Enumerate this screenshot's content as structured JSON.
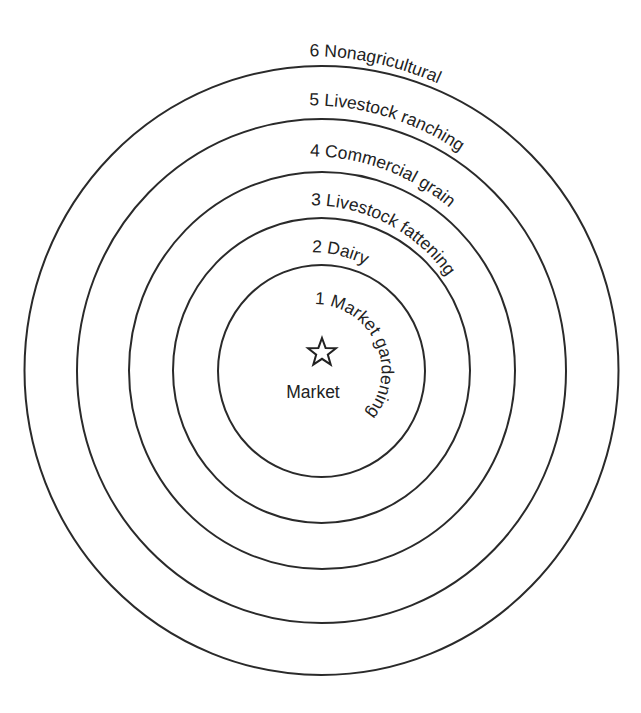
{
  "diagram": {
    "center": {
      "label": "Market",
      "icon": "star-icon"
    },
    "zones": [
      {
        "number": "1",
        "name": "Market gardening",
        "text": "1  Market gardening"
      },
      {
        "number": "2",
        "name": "Dairy",
        "text": "2  Dairy"
      },
      {
        "number": "3",
        "name": "Livestock fattening",
        "text": "3  Livestock fattening"
      },
      {
        "number": "4",
        "name": "Commercial grain",
        "text": "4  Commercial grain"
      },
      {
        "number": "5",
        "name": "Livestock ranching",
        "text": "5  Livestock ranching"
      },
      {
        "number": "6",
        "name": "Nonagricultural",
        "text": "6  Nonagricultural"
      }
    ],
    "colors": {
      "line": "#2a2a2a",
      "text": "#222222",
      "background": "#ffffff"
    }
  }
}
